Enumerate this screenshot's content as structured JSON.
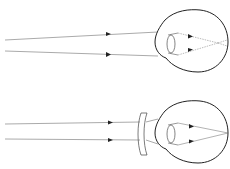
{
  "figure": {
    "title": "Myopia and its correction with a concave lens",
    "panels": [
      {
        "name": "uncorrected-myopic-eye",
        "caption": ""
      },
      {
        "name": "corrected-with-concave-lens",
        "caption": ""
      }
    ]
  },
  "colors": {
    "stroke": "#222222",
    "ray": "#555555",
    "background": "#ffffff"
  }
}
